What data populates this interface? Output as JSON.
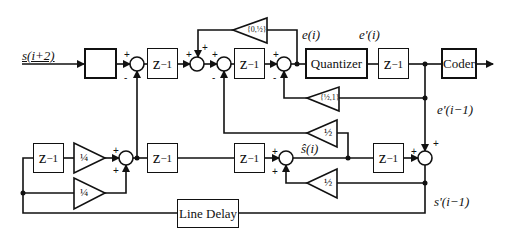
{
  "diagram": {
    "input_label": "s(i+2)",
    "limiter_symbol": "∫",
    "delay_label": "z",
    "delay_exp": "−1",
    "quantizer_label": "Quantizer",
    "coder_label": "Coder",
    "line_delay_label": "Line Delay",
    "signals": {
      "e_i": "e(i)",
      "e_prime_i": "e'(i)",
      "e_prime_i_minus_1": "e'(i−1)",
      "s_hat_i": "ŝ(i)",
      "s_prime_i_minus_1": "s'(i−1)"
    },
    "gains": {
      "top_feedback": "{0,½}",
      "quantizer_feedback": "{½,1}",
      "half_upper": "½",
      "half_lower": "½",
      "quarter_upper": "¼",
      "quarter_lower": "¼"
    },
    "signs": {
      "plus": "+",
      "minus": "-"
    },
    "colors": {
      "line": "#111111",
      "background": "#ffffff"
    }
  }
}
